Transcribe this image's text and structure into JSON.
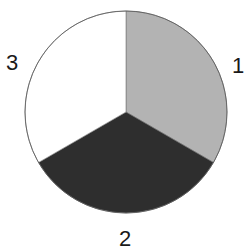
{
  "chart_data": {
    "type": "pie",
    "title": "",
    "categories": [
      "1",
      "2",
      "3"
    ],
    "values": [
      1,
      1,
      1
    ],
    "percentages": [
      33.3,
      33.3,
      33.3
    ],
    "colors": [
      "#b3b3b3",
      "#2e2e2e",
      "#ffffff"
    ],
    "start_angle_deg": 90,
    "direction": "clockwise",
    "labels_outside": true,
    "legend": null,
    "outline_color": "#555555"
  },
  "labels": {
    "slice1": "1",
    "slice2": "2",
    "slice3": "3"
  }
}
